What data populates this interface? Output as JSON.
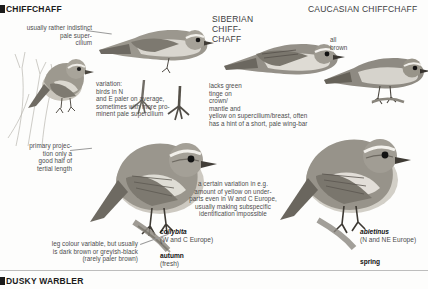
{
  "page": {
    "plate_title": "CHIFFCHAFF",
    "bottom_species": "DUSKY WARBLER"
  },
  "headings": [
    {
      "id": "chiffchaff",
      "text": "CHIFFCHAFF"
    },
    {
      "id": "siberian-chiffchaff",
      "text": "SIBERIAN CHIFF-\nCHAFF"
    },
    {
      "id": "caucasian-chiffchaff",
      "text": "CAUCASIAN CHIFFCHAFF"
    }
  ],
  "notes": {
    "pale_supercilium": "usually rather indistinct\npale super-\ncilium",
    "variation_north_east": "variation:\nbirds in N\nand E paler on average,\nsometimes with more pro-\nminent pale supercilium",
    "primary_projection": "primary projec-\ntion only a\ngood half of\ntertial length",
    "lacks_green_tinge": "lacks green\ntinge on\ncrown/\nmantle and\nyellow on supercilium/breast, often\nhas a hint of a short, pale wing-bar",
    "all_brown": "all\nbrown",
    "certain_variation": "a certain variation in e.g.\namount of yellow on under-\nparts even in W and C Europe,\nusually making subspecific\nidentification impossible",
    "leg_colour": "leg colour variable, but usually\nis dark brown or greyish-black\n(rarely paler brown)"
  },
  "subspecies": [
    {
      "latin": "collybita",
      "region": "(W and C Europe)"
    },
    {
      "latin": "abietinus",
      "region": "(N and NE Europe)"
    }
  ],
  "seasons": [
    {
      "season": "autumn",
      "qualifier": "(fresh)"
    },
    {
      "season": "spring",
      "qualifier": ""
    }
  ],
  "colors": {
    "ink": "#1b1b1b",
    "note_grey": "#4c4c4c",
    "plumage_upper": "#8d8a82",
    "plumage_under": "#dedbd4",
    "leader": "#9a9a9a"
  }
}
